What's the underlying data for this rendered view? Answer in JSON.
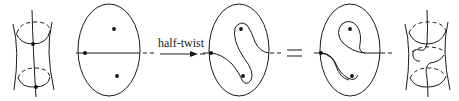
{
  "figure": {
    "arrow_label": "half-twist",
    "equals_sign": "=",
    "colors": {
      "ink": "#1a1a1a",
      "background": "#ffffff"
    },
    "panels": [
      {
        "id": "cylinder-left",
        "kind": "surface",
        "description": "cylinder with two circles and a vertical arc"
      },
      {
        "id": "disk-1",
        "kind": "disk",
        "marked_points": 2,
        "arc": "straight horizontal"
      },
      {
        "id": "disk-2",
        "kind": "disk",
        "marked_points": 2,
        "arc": "S-shaped, after half-twist"
      },
      {
        "id": "disk-3",
        "kind": "disk",
        "marked_points": 2,
        "arc": "curved around upper point"
      },
      {
        "id": "cylinder-right",
        "kind": "surface",
        "description": "cylinder with twisted arc"
      }
    ]
  }
}
